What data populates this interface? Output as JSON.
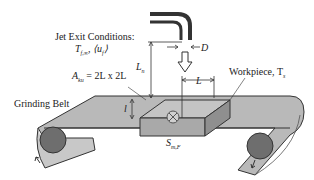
{
  "diagram": {
    "labels": {
      "jet_exit_title": "Jet Exit Conditions:",
      "jet_exit_vars": "T",
      "jet_exit_sub": "f,∞",
      "jet_exit_vel": ", ⟨u",
      "jet_exit_vel_sub": "f",
      "jet_exit_vel_end": "⟩",
      "area_A": "A",
      "area_sub": "ku",
      "area_eq": " = 2L x 2L",
      "nozzle_distance": "L",
      "nozzle_distance_sub": "n",
      "diameter": "D",
      "length": "L",
      "workpiece": "Workpiece, T",
      "workpiece_sub": "s",
      "grinding_belt": "Grinding Belt",
      "thickness": "l",
      "source": "S",
      "source_sub": "m,F"
    },
    "colors": {
      "nozzle": "#333333",
      "belt": "#b9b9b9",
      "belt_dark": "#8a8a8a",
      "workpiece_top": "#c4c4c4",
      "workpiece_side": "#9a9a9a",
      "roller": "#6e6e6e",
      "outline": "#333333"
    }
  }
}
